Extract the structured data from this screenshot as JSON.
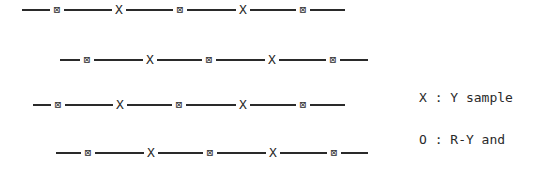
{
  "diagram": {
    "rows": [
      {
        "offset_x": 22,
        "sequence": [
          "O",
          "X",
          "O",
          "X",
          "O"
        ],
        "symbol_x": [
          57,
          119,
          180,
          243,
          303
        ],
        "line_end": 345,
        "y": 9
      },
      {
        "offset_x": 60,
        "sequence": [
          "O",
          "X",
          "O",
          "X",
          "O"
        ],
        "symbol_x": [
          87,
          150,
          209,
          272,
          333
        ],
        "line_end": 368,
        "y": 59
      },
      {
        "offset_x": 33,
        "sequence": [
          "O",
          "X",
          "O",
          "X",
          "O"
        ],
        "symbol_x": [
          58,
          120,
          179,
          243,
          303
        ],
        "line_end": 345,
        "y": 104
      },
      {
        "offset_x": 56,
        "sequence": [
          "O",
          "X",
          "O",
          "X",
          "O"
        ],
        "symbol_x": [
          88,
          151,
          210,
          273,
          334
        ],
        "line_end": 368,
        "y": 152
      }
    ],
    "symbols": {
      "X": "X",
      "O": "⊠"
    }
  },
  "legend": {
    "line1": "X : Y sample",
    "line2": "O : R-Y and",
    "line3": "    B-Y sample"
  }
}
